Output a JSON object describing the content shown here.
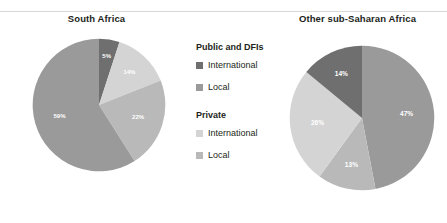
{
  "figure": {
    "top_divider": true,
    "ghost_text": ""
  },
  "colors": {
    "public_international": "#6f6f6f",
    "public_local": "#9a9a9a",
    "private_international": "#d4d4d4",
    "private_local": "#b9b9b9",
    "label_text": "#ffffff",
    "title_text": "#231f20",
    "divider": "#d8d8d8"
  },
  "legend": {
    "groups": [
      {
        "title": "Public and DFIs",
        "items": [
          {
            "label": "International",
            "color": "#6f6f6f"
          },
          {
            "label": "Local",
            "color": "#9a9a9a"
          }
        ]
      },
      {
        "title": "Private",
        "items": [
          {
            "label": "International",
            "color": "#d4d4d4"
          },
          {
            "label": "Local",
            "color": "#b9b9b9"
          }
        ]
      }
    ]
  },
  "chart_data": [
    {
      "type": "pie",
      "title": "South Africa",
      "xlabel": "",
      "ylabel": "",
      "legend_position": "center-shared",
      "start_angle_deg": 0,
      "direction": "clockwise",
      "categories": [
        "Public and DFIs - International",
        "Private - International",
        "Private - Local",
        "Public and DFIs - Local"
      ],
      "values": [
        5,
        14,
        22,
        59
      ],
      "labels": [
        "5%",
        "14%",
        "22%",
        "59%"
      ],
      "colors": [
        "#6f6f6f",
        "#d4d4d4",
        "#b9b9b9",
        "#9a9a9a"
      ]
    },
    {
      "type": "pie",
      "title": "Other sub-Saharan Africa",
      "xlabel": "",
      "ylabel": "",
      "legend_position": "center-shared",
      "start_angle_deg": 0,
      "direction": "clockwise",
      "categories": [
        "Public and DFIs - Local",
        "Private - Local",
        "Private - International",
        "Public and DFIs - International"
      ],
      "values": [
        47,
        13,
        26,
        14
      ],
      "labels": [
        "47%",
        "13%",
        "26%",
        "14%"
      ],
      "colors": [
        "#9a9a9a",
        "#b9b9b9",
        "#d4d4d4",
        "#6f6f6f"
      ]
    }
  ]
}
